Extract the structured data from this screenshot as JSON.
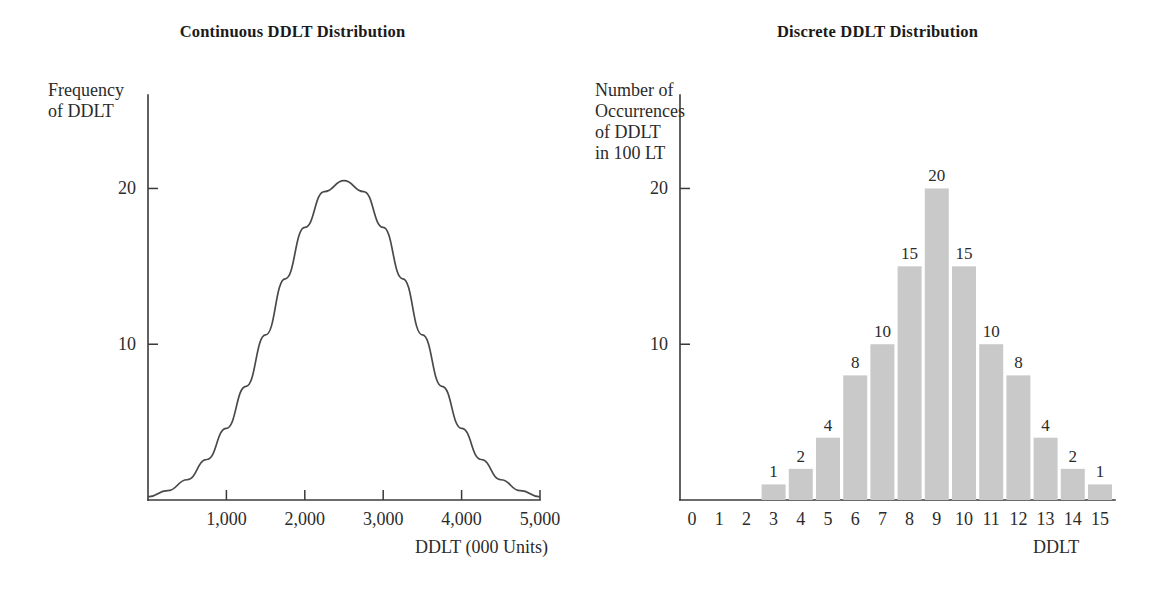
{
  "figure": {
    "background": "#ffffff",
    "ink_color": "#2b2b2b",
    "bar_color": "#c9c9c9",
    "curve_color": "#4a4a4a"
  },
  "panels": {
    "continuous": {
      "title": "Continuous DDLT Distribution",
      "ylabel": "Frequency\nof DDLT",
      "xlabel": "DDLT (000 Units)"
    },
    "discrete": {
      "title": "Discrete DDLT Distribution",
      "ylabel": "Number of\nOccurrences\nof DDLT\nin 100 LT",
      "xlabel": "DDLT"
    }
  },
  "chart_data": [
    {
      "type": "line",
      "title": "Continuous DDLT Distribution",
      "xlabel": "DDLT (000 Units)",
      "ylabel": "Frequency of DDLT",
      "xlim": [
        0,
        5000
      ],
      "ylim": [
        0,
        26
      ],
      "xticks": [
        1000,
        2000,
        3000,
        4000,
        5000
      ],
      "xticklabels": [
        "1,000",
        "2,000",
        "3,000",
        "4,000",
        "5,000"
      ],
      "yticks": [
        10,
        20
      ],
      "yticklabels": [
        "10",
        "20"
      ],
      "grid": false,
      "legend": false,
      "distribution": {
        "shape": "normal",
        "mean": 2500,
        "std_dev": 900,
        "peak_value": 20.5
      },
      "x": [
        0,
        250,
        500,
        750,
        1000,
        1250,
        1500,
        1750,
        2000,
        2250,
        2500,
        2750,
        3000,
        3250,
        3500,
        3750,
        4000,
        4250,
        4500,
        4750,
        5000
      ],
      "y": [
        0.2,
        0.6,
        1.3,
        2.6,
        4.6,
        7.3,
        10.6,
        14.2,
        17.5,
        19.8,
        20.5,
        19.8,
        17.5,
        14.2,
        10.6,
        7.3,
        4.6,
        2.6,
        1.3,
        0.6,
        0.2
      ]
    },
    {
      "type": "bar",
      "title": "Discrete DDLT Distribution",
      "xlabel": "DDLT",
      "ylabel": "Number of Occurrences of DDLT in 100 LT",
      "categories": [
        "0",
        "1",
        "2",
        "3",
        "4",
        "5",
        "6",
        "7",
        "8",
        "9",
        "10",
        "11",
        "12",
        "13",
        "14",
        "15"
      ],
      "values": [
        0,
        0,
        0,
        1,
        2,
        4,
        8,
        10,
        15,
        20,
        15,
        10,
        8,
        4,
        2,
        1
      ],
      "bar_labels": [
        "",
        "",
        "",
        "1",
        "2",
        "4",
        "8",
        "10",
        "15",
        "20",
        "15",
        "10",
        "8",
        "4",
        "2",
        "1"
      ],
      "xlim": [
        0,
        15
      ],
      "ylim": [
        0,
        26
      ],
      "yticks": [
        10,
        20
      ],
      "yticklabels": [
        "10",
        "20"
      ],
      "grid": false,
      "legend": false,
      "total": 100
    }
  ]
}
